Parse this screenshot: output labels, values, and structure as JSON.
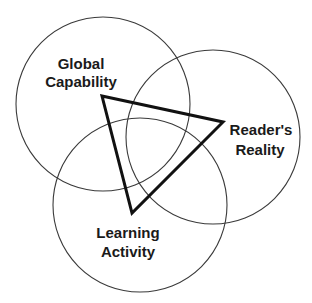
{
  "diagram": {
    "type": "venn",
    "background": "#ffffff",
    "stroke_color": "#3a3a3a",
    "circles": [
      {
        "id": "global-capability",
        "cx": 103,
        "cy": 104,
        "r": 87,
        "label_lines": [
          "Global",
          "Capability"
        ]
      },
      {
        "id": "readers-reality",
        "cx": 213,
        "cy": 137,
        "r": 87,
        "label_lines": [
          "Reader's",
          "Reality"
        ]
      },
      {
        "id": "learning-activity",
        "cx": 140,
        "cy": 205,
        "r": 87,
        "label_lines": [
          "Learning",
          "Activity"
        ]
      }
    ],
    "triangle": {
      "color": "#111111",
      "points": [
        [
          102,
          96
        ],
        [
          223,
          122
        ],
        [
          132,
          213
        ]
      ]
    },
    "labels": {
      "global": {
        "line1": "Global",
        "line2": "Capability"
      },
      "reader": {
        "line1": "Reader's",
        "line2": "Reality"
      },
      "learning": {
        "line1": "Learning",
        "line2": "Activity"
      }
    }
  }
}
